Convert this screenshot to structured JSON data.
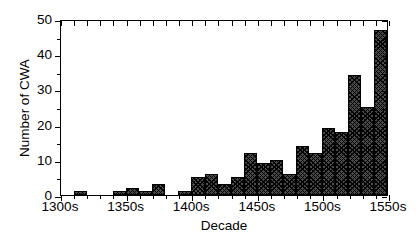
{
  "chart_data": {
    "type": "bar",
    "title": "",
    "xlabel": "Decade",
    "ylabel": "Number of CWA",
    "xlim": [
      "1300s",
      "1550s"
    ],
    "ylim": [
      0,
      50
    ],
    "yticks": [
      0,
      10,
      20,
      30,
      40,
      50
    ],
    "yticklabels": [
      "0",
      "10",
      "20",
      "30",
      "40",
      "50"
    ],
    "xticks": [
      "1300s",
      "1350s",
      "1400s",
      "1450s",
      "1500s",
      "1550s"
    ],
    "grid": false,
    "legend": null,
    "bar_fill": "#4a4a4a",
    "bar_hatch": "crosshatch",
    "categories": [
      "1300s",
      "1310s",
      "1320s",
      "1330s",
      "1340s",
      "1350s",
      "1360s",
      "1370s",
      "1380s",
      "1390s",
      "1400s",
      "1410s",
      "1420s",
      "1430s",
      "1440s",
      "1450s",
      "1460s",
      "1470s",
      "1480s",
      "1490s",
      "1500s",
      "1510s",
      "1520s",
      "1530s",
      "1540s"
    ],
    "values": [
      0,
      1,
      0,
      0,
      1,
      2,
      1,
      3,
      0,
      1,
      5,
      6,
      3,
      5,
      12,
      9,
      10,
      6,
      14,
      12,
      19,
      18,
      34,
      25,
      47
    ]
  },
  "axes": {
    "ylabel": "Number of CWA",
    "xlabel": "Decade"
  }
}
